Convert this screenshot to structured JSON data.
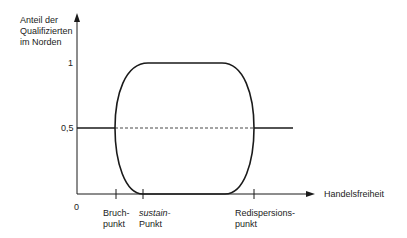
{
  "diagram": {
    "y_axis_label": [
      "Anteil der",
      "Qualifizierten",
      "im Norden"
    ],
    "x_axis_label": "Handelsfreiheit",
    "origin_label": "0",
    "y_ticks": [
      {
        "label": "1",
        "value": 1
      },
      {
        "label": "0,5",
        "value": 0.5
      }
    ],
    "x_markers": [
      {
        "line1": "Bruch-",
        "line2": "punkt",
        "italic": false
      },
      {
        "line1": "sustain-",
        "line2": "Punkt",
        "italic_line1": true
      },
      {
        "line1": "Redispersions-",
        "line2": "punkt",
        "italic": false
      }
    ],
    "colors": {
      "line": "#1a1a1a",
      "background": "#ffffff"
    }
  }
}
